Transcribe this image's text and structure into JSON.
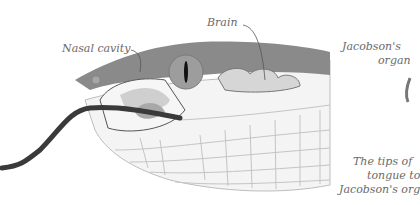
{
  "labels": {
    "nasal_cavity": "Nasal cavity",
    "brain": "Brain",
    "jacobsons_organ_line1": "Jacobson's",
    "jacobsons_organ_line2": "organ",
    "caption_line1": "The tips of",
    "caption_line2": "tongue to",
    "caption_line3": "Jacobson's org"
  },
  "colors": {
    "background": "#ffffff",
    "head_top": "#8a8a8a",
    "eye": "#9a9a9a",
    "pupil": "#111111",
    "tongue": "#3a3a3a",
    "brain": "#d4d4d4",
    "nasal": "#c8c8c8",
    "scale_lines": "#bdbdbd",
    "label_text": "#6a6a6a"
  }
}
